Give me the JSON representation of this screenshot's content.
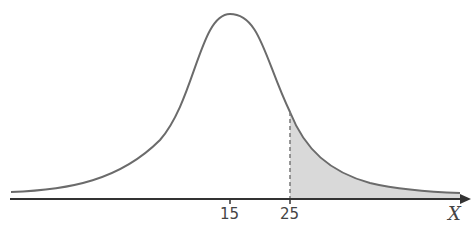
{
  "diagram": {
    "type": "normal-distribution-curve",
    "axis_label": "X",
    "ticks": [
      {
        "label": "15",
        "role": "mean"
      },
      {
        "label": "25",
        "role": "cutoff"
      }
    ],
    "shaded_region": "right tail beyond 25",
    "colors": {
      "curve": "#6b6b6b",
      "axis": "#333333",
      "shade": "#d9d9d9",
      "dashed_line": "#777777"
    }
  }
}
